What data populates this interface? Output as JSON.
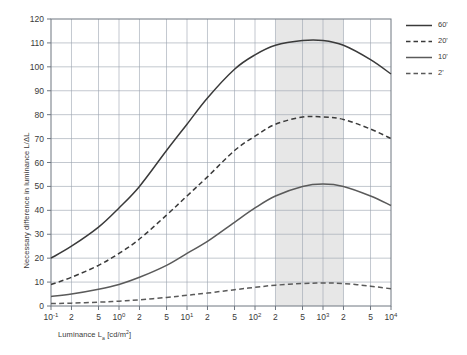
{
  "chart_data": {
    "type": "line",
    "title": "",
    "subtitle": "",
    "xlabel": "Luminance L_a [cd/m²]",
    "xlabel_parts": {
      "pre": "Luminance L",
      "sub": "a",
      "post": " [cd/m",
      "sup": "2",
      "tail": "]"
    },
    "ylabel": "Necessary difference in luminance L/ΔL",
    "xscale": "log",
    "xlim": [
      0.1,
      10000
    ],
    "ylim": [
      0,
      120
    ],
    "ytick_step": 10,
    "yticks": [
      0,
      10,
      20,
      30,
      40,
      50,
      60,
      70,
      80,
      90,
      100,
      110,
      120
    ],
    "ytick_labels": [
      "0",
      "10",
      "20",
      "30",
      "40",
      "50",
      "60",
      "70",
      "80",
      "90",
      "100",
      "110",
      "120"
    ],
    "xticks": [
      0.1,
      0.2,
      0.5,
      1,
      2,
      5,
      10,
      20,
      50,
      100,
      200,
      500,
      1000,
      2000,
      5000,
      10000
    ],
    "xtick_labels": [
      {
        "base": "10",
        "exp": "-1"
      },
      {
        "base": "2",
        "exp": ""
      },
      {
        "base": "5",
        "exp": ""
      },
      {
        "base": "10",
        "exp": "0"
      },
      {
        "base": "2",
        "exp": ""
      },
      {
        "base": "5",
        "exp": ""
      },
      {
        "base": "10",
        "exp": "1"
      },
      {
        "base": "2",
        "exp": ""
      },
      {
        "base": "5",
        "exp": ""
      },
      {
        "base": "10",
        "exp": "2"
      },
      {
        "base": "2",
        "exp": ""
      },
      {
        "base": "5",
        "exp": ""
      },
      {
        "base": "10",
        "exp": "3"
      },
      {
        "base": "2",
        "exp": ""
      },
      {
        "base": "5",
        "exp": ""
      },
      {
        "base": "10",
        "exp": "4"
      }
    ],
    "grid": true,
    "grid_color": "#9aa3ae",
    "axis_color": "#6e7680",
    "legend_position": "right",
    "highlight_band": {
      "label": "",
      "x_from": 200,
      "x_to": 2000,
      "color": "#e7e7e7"
    },
    "series": [
      {
        "name": "60'",
        "style": "solid",
        "color": "#3a3a3a",
        "x": [
          0.1,
          0.2,
          0.5,
          1,
          2,
          5,
          10,
          20,
          50,
          100,
          200,
          500,
          1000,
          2000,
          5000,
          10000
        ],
        "values": [
          20,
          25,
          33,
          41,
          50,
          65,
          76,
          87,
          99,
          105,
          109,
          111,
          111,
          109,
          103,
          97
        ]
      },
      {
        "name": "20'",
        "style": "dashed",
        "color": "#3a3a3a",
        "x": [
          0.1,
          0.2,
          0.5,
          1,
          2,
          5,
          10,
          20,
          50,
          100,
          200,
          500,
          1000,
          2000,
          5000,
          10000
        ],
        "values": [
          9,
          12,
          17,
          22,
          28,
          38,
          46,
          54,
          65,
          71,
          76,
          79,
          79,
          78,
          74,
          70
        ]
      },
      {
        "name": "10'",
        "style": "solid",
        "color": "#5a5a5a",
        "x": [
          0.1,
          0.2,
          0.5,
          1,
          2,
          5,
          10,
          20,
          50,
          100,
          200,
          500,
          1000,
          2000,
          5000,
          10000
        ],
        "values": [
          4,
          5,
          7,
          9,
          12,
          17,
          22,
          27,
          35,
          41,
          46,
          50,
          51,
          50,
          46,
          42
        ]
      },
      {
        "name": "2'",
        "style": "dashed",
        "color": "#5a5a5a",
        "x": [
          0.1,
          0.2,
          0.5,
          1,
          2,
          5,
          10,
          20,
          50,
          100,
          200,
          500,
          1000,
          2000,
          5000,
          10000
        ],
        "values": [
          1,
          1.2,
          1.6,
          2,
          2.6,
          3.6,
          4.5,
          5.4,
          6.8,
          7.8,
          8.7,
          9.4,
          9.6,
          9.4,
          8.3,
          7.2
        ]
      }
    ]
  },
  "legend": {
    "items": [
      {
        "label": "60'",
        "style": "solid",
        "color": "#3a3a3a"
      },
      {
        "label": "20'",
        "style": "dashed",
        "color": "#3a3a3a"
      },
      {
        "label": "10'",
        "style": "solid",
        "color": "#5a5a5a"
      },
      {
        "label": "2'",
        "style": "dashed",
        "color": "#5a5a5a"
      }
    ]
  }
}
